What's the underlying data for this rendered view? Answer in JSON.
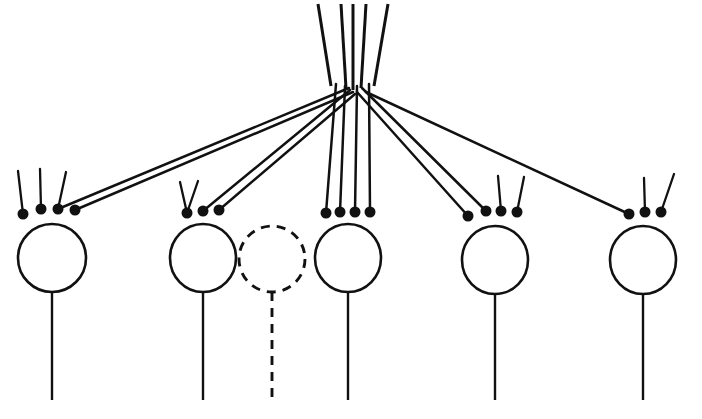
{
  "figure": {
    "background_color": "#ffffff",
    "ink_color": "#111111",
    "width": 702,
    "height": 419
  },
  "afferent": {
    "name": "afferent-axon-bundle",
    "trunk_count": 5,
    "trunk_label": "ascending afferent fibers",
    "branch_point": {
      "x": 352,
      "y": 92
    },
    "trunks": [
      {
        "id": "trunk-1",
        "x_top": 318,
        "y_top": 4,
        "x_bottom": 331,
        "y_bottom": 86
      },
      {
        "id": "trunk-2",
        "x_top": 341,
        "y_top": 4,
        "x_bottom": 346,
        "y_bottom": 88
      },
      {
        "id": "trunk-3",
        "x_top": 353,
        "y_top": 4,
        "x_bottom": 353,
        "y_bottom": 90
      },
      {
        "id": "trunk-4",
        "x_top": 366,
        "y_top": 4,
        "x_bottom": 361,
        "y_bottom": 88
      },
      {
        "id": "trunk-5",
        "x_top": 388,
        "y_top": 4,
        "x_bottom": 374,
        "y_bottom": 86
      }
    ]
  },
  "neurons": [
    {
      "id": "neuron-1",
      "label": "cortical neuron 1",
      "style": "solid",
      "soma": {
        "cx": 52,
        "cy": 258,
        "rx": 34,
        "ry": 34
      },
      "axon": {
        "x": 52,
        "y_top": 292,
        "y_bottom": 400
      },
      "bouton_count": 4,
      "boutons": [
        {
          "x": 23,
          "y": 214,
          "r": 5.5,
          "source": "local"
        },
        {
          "x": 41,
          "y": 209,
          "r": 5.5,
          "source": "local"
        },
        {
          "x": 58,
          "y": 209,
          "r": 5.5,
          "source": "afferent"
        },
        {
          "x": 75,
          "y": 210,
          "r": 5.5,
          "source": "afferent"
        }
      ],
      "local_fibers": [
        {
          "x1": 23,
          "y1": 214,
          "x2": 18,
          "y2": 171
        },
        {
          "x1": 41,
          "y1": 209,
          "x2": 40,
          "y2": 169
        },
        {
          "x1": 58,
          "y1": 209,
          "x2": 66,
          "y2": 172
        }
      ],
      "afferent_inputs": 2
    },
    {
      "id": "neuron-2",
      "label": "cortical neuron 2",
      "style": "solid",
      "soma": {
        "cx": 203,
        "cy": 258,
        "rx": 33,
        "ry": 34
      },
      "axon": {
        "x": 203,
        "y_top": 292,
        "y_bottom": 400
      },
      "bouton_count": 3,
      "boutons": [
        {
          "x": 187,
          "y": 213,
          "r": 5.5,
          "source": "local"
        },
        {
          "x": 203,
          "y": 211,
          "r": 5.5,
          "source": "afferent"
        },
        {
          "x": 219,
          "y": 210,
          "r": 5.5,
          "source": "afferent"
        }
      ],
      "local_fibers": [
        {
          "x1": 187,
          "y1": 213,
          "x2": 180,
          "y2": 182
        },
        {
          "x1": 187,
          "y1": 213,
          "x2": 198,
          "y2": 181
        }
      ],
      "afferent_inputs": 2
    },
    {
      "id": "neuron-3-absent",
      "label": "absent / potential neuron",
      "style": "dashed",
      "soma": {
        "cx": 272,
        "cy": 259,
        "rx": 33,
        "ry": 33
      },
      "axon": {
        "x": 272,
        "y_top": 292,
        "y_bottom": 400
      },
      "bouton_count": 0,
      "boutons": [],
      "local_fibers": [],
      "afferent_inputs": 0
    },
    {
      "id": "neuron-4",
      "label": "cortical neuron 3",
      "style": "solid",
      "soma": {
        "cx": 348,
        "cy": 258,
        "rx": 33,
        "ry": 34
      },
      "axon": {
        "x": 348,
        "y_top": 292,
        "y_bottom": 400
      },
      "bouton_count": 4,
      "boutons": [
        {
          "x": 326,
          "y": 213,
          "r": 5.5,
          "source": "afferent"
        },
        {
          "x": 340,
          "y": 212,
          "r": 5.5,
          "source": "afferent"
        },
        {
          "x": 355,
          "y": 212,
          "r": 5.5,
          "source": "afferent"
        },
        {
          "x": 370,
          "y": 212,
          "r": 5.5,
          "source": "afferent"
        }
      ],
      "local_fibers": [],
      "afferent_inputs": 4
    },
    {
      "id": "neuron-5",
      "label": "cortical neuron 4",
      "style": "solid",
      "soma": {
        "cx": 495,
        "cy": 260,
        "rx": 33,
        "ry": 34
      },
      "axon": {
        "x": 495,
        "y_top": 294,
        "y_bottom": 400
      },
      "bouton_count": 4,
      "boutons": [
        {
          "x": 468,
          "y": 216,
          "r": 5.5,
          "source": "afferent"
        },
        {
          "x": 486,
          "y": 211,
          "r": 5.5,
          "source": "afferent"
        },
        {
          "x": 501,
          "y": 211,
          "r": 5.5,
          "source": "local"
        },
        {
          "x": 517,
          "y": 212,
          "r": 5.5,
          "source": "local"
        }
      ],
      "local_fibers": [
        {
          "x1": 501,
          "y1": 211,
          "x2": 498,
          "y2": 176
        },
        {
          "x1": 517,
          "y1": 212,
          "x2": 524,
          "y2": 177
        }
      ],
      "afferent_inputs": 2
    },
    {
      "id": "neuron-6",
      "label": "cortical neuron 5",
      "style": "solid",
      "soma": {
        "cx": 643,
        "cy": 260,
        "rx": 33,
        "ry": 34
      },
      "axon": {
        "x": 643,
        "y_top": 294,
        "y_bottom": 400
      },
      "bouton_count": 3,
      "boutons": [
        {
          "x": 629,
          "y": 214,
          "r": 5.5,
          "source": "afferent"
        },
        {
          "x": 645,
          "y": 212,
          "r": 5.5,
          "source": "local"
        },
        {
          "x": 661,
          "y": 212,
          "r": 5.5,
          "source": "local"
        }
      ],
      "local_fibers": [
        {
          "x1": 645,
          "y1": 212,
          "x2": 644,
          "y2": 178
        },
        {
          "x1": 661,
          "y1": 212,
          "x2": 674,
          "y2": 174
        }
      ],
      "afferent_inputs": 1
    }
  ],
  "afferent_branches": [
    {
      "id": "branch-n1-a",
      "x1": 349,
      "y1": 88,
      "x2": 58,
      "y2": 209,
      "target": "neuron-1"
    },
    {
      "id": "branch-n1-b",
      "x1": 353,
      "y1": 92,
      "x2": 75,
      "y2": 210,
      "target": "neuron-1"
    },
    {
      "id": "branch-n2-a",
      "x1": 350,
      "y1": 90,
      "x2": 203,
      "y2": 211,
      "target": "neuron-2"
    },
    {
      "id": "branch-n2-b",
      "x1": 355,
      "y1": 94,
      "x2": 219,
      "y2": 210,
      "target": "neuron-2"
    },
    {
      "id": "branch-n4-a",
      "x1": 336,
      "y1": 84,
      "x2": 326,
      "y2": 213,
      "target": "neuron-4"
    },
    {
      "id": "branch-n4-b",
      "x1": 345,
      "y1": 86,
      "x2": 340,
      "y2": 212,
      "target": "neuron-4"
    },
    {
      "id": "branch-n4-c",
      "x1": 357,
      "y1": 86,
      "x2": 355,
      "y2": 212,
      "target": "neuron-4"
    },
    {
      "id": "branch-n4-d",
      "x1": 369,
      "y1": 84,
      "x2": 370,
      "y2": 212,
      "target": "neuron-4"
    },
    {
      "id": "branch-n5-a",
      "x1": 357,
      "y1": 92,
      "x2": 468,
      "y2": 216,
      "target": "neuron-5"
    },
    {
      "id": "branch-n5-b",
      "x1": 362,
      "y1": 88,
      "x2": 486,
      "y2": 211,
      "target": "neuron-5"
    },
    {
      "id": "branch-n6-a",
      "x1": 366,
      "y1": 92,
      "x2": 629,
      "y2": 214,
      "target": "neuron-6"
    }
  ]
}
